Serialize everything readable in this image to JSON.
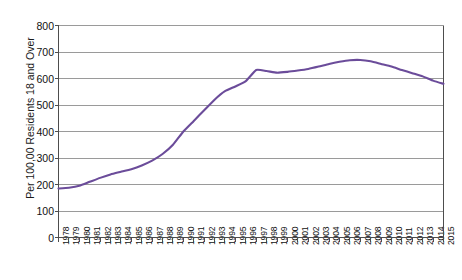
{
  "chart_data": {
    "type": "line",
    "title": "",
    "xlabel": "",
    "ylabel": "Per 100,00 Residents 18 and Over",
    "ylim": [
      0,
      800
    ],
    "yticks": [
      0,
      100,
      200,
      300,
      400,
      500,
      600,
      700,
      800
    ],
    "grid": "horizontal",
    "legend": "none",
    "line_color": "#6B4C9A",
    "background_color": "#FFFFFF",
    "gridline_color": "#9A9A9A",
    "axis_color": "#4D4D4D",
    "categories": [
      "1978",
      "1979",
      "1980",
      "1981",
      "1982",
      "1983",
      "1984",
      "1985",
      "1986",
      "1987",
      "1988",
      "1989",
      "1990",
      "1991",
      "1992",
      "1993",
      "1994",
      "1995",
      "1996",
      "1997",
      "1998",
      "1999",
      "2000",
      "2001",
      "2002",
      "2003",
      "2004",
      "2005",
      "2006",
      "2007",
      "2008",
      "2009",
      "2010",
      "2011",
      "2012",
      "2013",
      "2014",
      "2015"
    ],
    "values": [
      185,
      188,
      195,
      210,
      225,
      238,
      248,
      258,
      272,
      290,
      315,
      350,
      400,
      440,
      480,
      520,
      552,
      570,
      590,
      632,
      628,
      622,
      625,
      630,
      636,
      645,
      655,
      663,
      669,
      670,
      665,
      655,
      645,
      632,
      620,
      608,
      592,
      580
    ],
    "y_tick_labels": [
      "800",
      "700",
      "600",
      "500",
      "400",
      "300",
      "200",
      "100",
      "0"
    ]
  },
  "axis": {
    "y_title": "Per 100,00 Residents 18 and Over"
  }
}
